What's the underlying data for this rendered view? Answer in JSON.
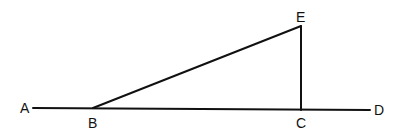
{
  "diagram": {
    "type": "geometry",
    "points": {
      "A": {
        "label": "A",
        "x": 33,
        "y": 108
      },
      "B": {
        "label": "B",
        "x": 93,
        "y": 108
      },
      "C": {
        "label": "C",
        "x": 301,
        "y": 110
      },
      "D": {
        "label": "D",
        "x": 370,
        "y": 110
      },
      "E": {
        "label": "E",
        "x": 301,
        "y": 26
      }
    },
    "segments": [
      {
        "from": "A",
        "to": "D",
        "description": "line AD through B and C"
      },
      {
        "from": "B",
        "to": "E",
        "description": "segment BE"
      },
      {
        "from": "E",
        "to": "C",
        "description": "segment EC perpendicular to AD"
      }
    ],
    "labels": {
      "A": "A",
      "B": "B",
      "C": "C",
      "D": "D",
      "E": "E"
    },
    "line_color": "#111111",
    "background": "#ffffff"
  }
}
